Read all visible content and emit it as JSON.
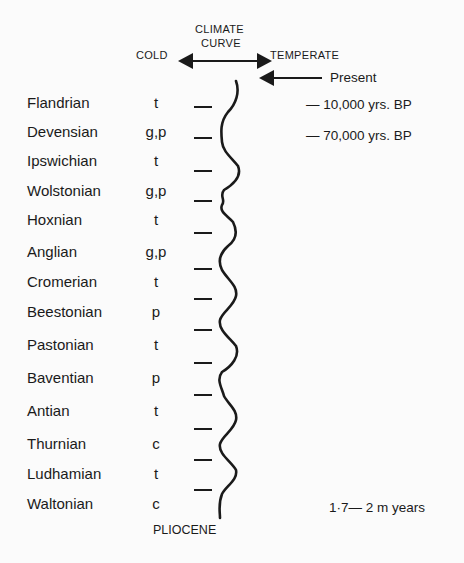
{
  "header": {
    "title_line1": "CLIMATE",
    "title_line2": "CURVE",
    "cold_label": "COLD",
    "temperate_label": "TEMPERATE"
  },
  "annotations": {
    "present": "Present",
    "mark_10k": "— 10,000 yrs. BP",
    "mark_70k": "— 70,000 yrs. BP",
    "base_age": "1·7— 2 m years",
    "base_label": "PLIOCENE"
  },
  "stages": [
    {
      "name": "Flandrian",
      "code": "t"
    },
    {
      "name": "Devensian",
      "code": "g,p"
    },
    {
      "name": "Ipswichian",
      "code": "t"
    },
    {
      "name": "Wolstonian",
      "code": "g,p"
    },
    {
      "name": "Hoxnian",
      "code": "t"
    },
    {
      "name": "Anglian",
      "code": "g,p"
    },
    {
      "name": "Cromerian",
      "code": "t"
    },
    {
      "name": "Beestonian",
      "code": "p"
    },
    {
      "name": "Pastonian",
      "code": "t"
    },
    {
      "name": "Baventian",
      "code": "p"
    },
    {
      "name": "Antian",
      "code": "t"
    },
    {
      "name": "Thurnian",
      "code": "c"
    },
    {
      "name": "Ludhamian",
      "code": "t"
    },
    {
      "name": "Waltonian",
      "code": "c"
    }
  ],
  "colors": {
    "ink": "#1a1a1a",
    "paper": "#fbfbfb"
  }
}
